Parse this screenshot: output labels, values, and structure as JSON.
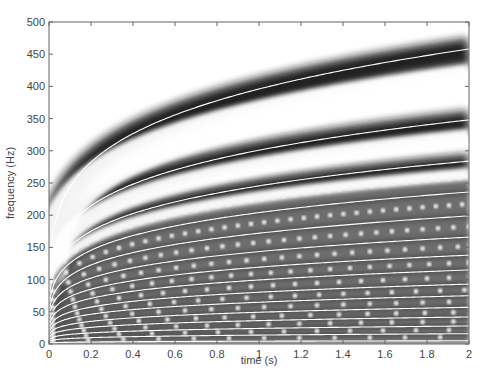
{
  "chart_data": {
    "type": "heatmap",
    "subtype": "spectrogram with overlaid harmonic tracks",
    "title": "",
    "xlabel": "time (s)",
    "ylabel": "frequency (Hz)",
    "xlim": [
      0,
      2
    ],
    "ylim": [
      0,
      500
    ],
    "xticks": [
      0,
      0.2,
      0.4,
      0.6,
      0.8,
      1,
      1.2,
      1.4,
      1.6,
      1.8,
      2
    ],
    "xtick_labels": [
      "0",
      "0.2",
      "0.4",
      "0.6",
      "0.8",
      "1",
      "1.2",
      "1.4",
      "1.6",
      "1.8",
      "2"
    ],
    "yticks": [
      0,
      50,
      100,
      150,
      200,
      250,
      300,
      350,
      400,
      450,
      500
    ],
    "ytick_labels": [
      "0",
      "50",
      "100",
      "150",
      "200",
      "250",
      "300",
      "350",
      "400",
      "450",
      "500"
    ],
    "grid": false,
    "colormap": "grayscale (inverted: dark = high energy)",
    "curve_model": "f(t) = f_at_2s * (t/2)^0.21",
    "track_frequencies_at_t2": [
      458,
      348,
      284,
      236,
      199,
      166,
      138,
      115,
      93,
      75,
      57,
      42,
      28,
      16,
      5
    ],
    "sample_points_top_track": [
      {
        "t": 0.2,
        "f": 273
      },
      {
        "t": 1.0,
        "f": 396
      },
      {
        "t": 2.0,
        "f": 458
      }
    ],
    "band_style": [
      {
        "index": 0,
        "dark_band": true
      },
      {
        "index": 1,
        "dark_band": true
      },
      {
        "index": 2,
        "dark_band": true
      },
      {
        "index": 3,
        "dotted": true
      }
    ],
    "track_color": "#ffffff",
    "band_color": "#1a1a1a",
    "background_color": "#ffffff"
  },
  "axes": {
    "xlabel": "time (s)",
    "ylabel": "frequency (Hz)"
  }
}
